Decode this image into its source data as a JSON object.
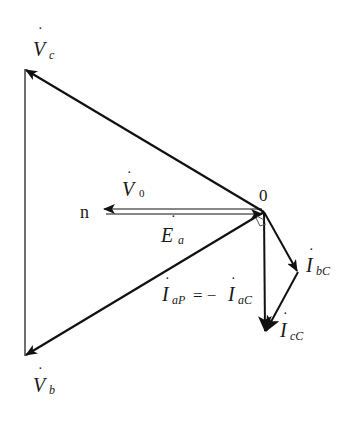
{
  "diagram": {
    "type": "phasor-diagram",
    "origin_label": "0",
    "neutral_label": "n",
    "colors": {
      "line": "#111111",
      "background": "#ffffff"
    },
    "labels": {
      "Vc": {
        "main": "V",
        "sub": "c"
      },
      "Vb": {
        "main": "V",
        "sub": "b"
      },
      "V0": {
        "main": "V",
        "sub": "0"
      },
      "Ea": {
        "main": "E",
        "sub": "a"
      },
      "IbC": {
        "main": "I",
        "sub": "bC"
      },
      "IcC": {
        "main": "I",
        "sub": "cC"
      },
      "IaP": {
        "main": "I",
        "sub": "aP"
      },
      "equals": "= −",
      "IaC": {
        "main": "I",
        "sub": "aC"
      }
    },
    "vectors": [
      {
        "name": "Vc",
        "from": [
          264,
          212
        ],
        "to": [
          25,
          69
        ]
      },
      {
        "name": "Vb",
        "from": [
          264,
          212
        ],
        "to": [
          25,
          356
        ]
      },
      {
        "name": "V0",
        "from": [
          264,
          212
        ],
        "to": [
          103,
          212
        ]
      },
      {
        "name": "Ea",
        "from": [
          103,
          212
        ],
        "to": [
          264,
          212
        ]
      },
      {
        "name": "IaP",
        "from": [
          264,
          212
        ],
        "to": [
          265,
          332
        ]
      },
      {
        "name": "IbC",
        "from": [
          264,
          212
        ],
        "to": [
          298,
          272
        ]
      },
      {
        "name": "IcC",
        "from": [
          298,
          272
        ],
        "to": [
          265,
          332
        ]
      }
    ]
  }
}
